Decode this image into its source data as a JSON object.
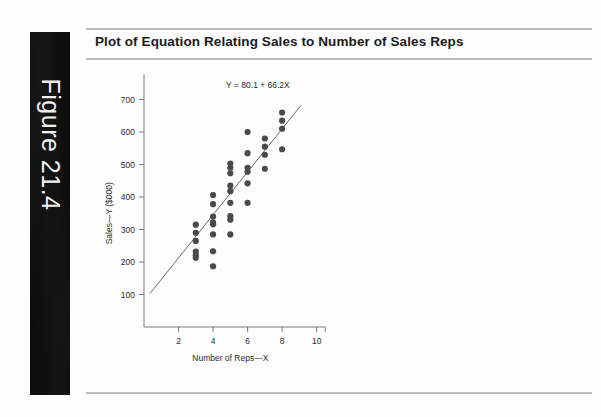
{
  "figure": {
    "strip_label": "Figure 21.4"
  },
  "card": {
    "title": "Plot of Equation Relating Sales to Number of Sales Reps"
  },
  "chart_data": {
    "type": "scatter",
    "title": "Plot of Equation Relating Sales to Number of Sales Reps",
    "xlabel": "Number of Reps—X",
    "ylabel": "Sales—Y ($000)",
    "xlim": [
      0,
      10.6
    ],
    "ylim": [
      0,
      760
    ],
    "xticks": [
      2,
      4,
      6,
      8,
      10
    ],
    "yticks": [
      100,
      200,
      300,
      400,
      500,
      600,
      700
    ],
    "xticklabels": [
      "2",
      "4",
      "6",
      "8",
      "10"
    ],
    "yticklabels": [
      "100",
      "200",
      "300",
      "400",
      "500",
      "600",
      "700"
    ],
    "grid": false,
    "legend": null,
    "annotations": [
      {
        "text": "Y = 80.1 + 66.2X",
        "x": 6.6,
        "y": 735
      }
    ],
    "series": [
      {
        "name": "Sales vs Reps",
        "type": "scatter",
        "marker": "circle",
        "color": "#4a4a4a",
        "points": [
          [
            3,
            315
          ],
          [
            3,
            290
          ],
          [
            3,
            265
          ],
          [
            3,
            232
          ],
          [
            3,
            221
          ],
          [
            3,
            213
          ],
          [
            4,
            406
          ],
          [
            4,
            378
          ],
          [
            4,
            340
          ],
          [
            4,
            322
          ],
          [
            4,
            316
          ],
          [
            4,
            285
          ],
          [
            4,
            233
          ],
          [
            4,
            187
          ],
          [
            5,
            503
          ],
          [
            5,
            490
          ],
          [
            5,
            473
          ],
          [
            5,
            435
          ],
          [
            5,
            418
          ],
          [
            5,
            382
          ],
          [
            5,
            341
          ],
          [
            5,
            330
          ],
          [
            5,
            285
          ],
          [
            6,
            600
          ],
          [
            6,
            535
          ],
          [
            6,
            490
          ],
          [
            6,
            478
          ],
          [
            6,
            442
          ],
          [
            6,
            382
          ],
          [
            7,
            580
          ],
          [
            7,
            555
          ],
          [
            7,
            530
          ],
          [
            7,
            487
          ],
          [
            8,
            660
          ],
          [
            8,
            635
          ],
          [
            8,
            610
          ],
          [
            8,
            547
          ]
        ]
      },
      {
        "name": "Regression line",
        "type": "line",
        "color": "#6a6a6a",
        "equation": "Y = 80.1 + 66.2X",
        "intercept": 80.1,
        "slope": 66.2,
        "x_range": [
          0.35,
          9.1
        ]
      }
    ]
  }
}
